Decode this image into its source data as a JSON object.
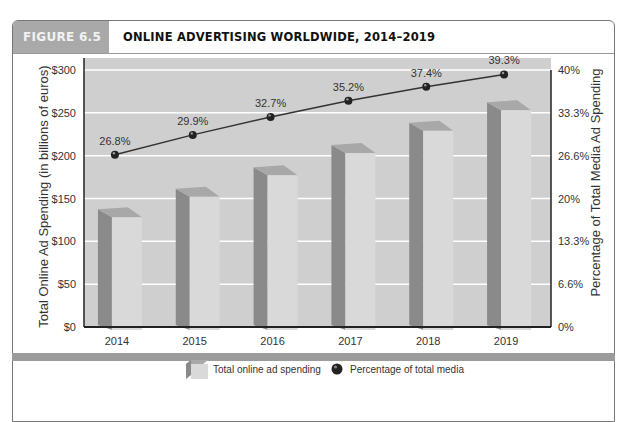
{
  "figure": {
    "tag": "FIGURE 6.5",
    "title": "ONLINE ADVERTISING WORLDWIDE, 2014–2019"
  },
  "chart_data": {
    "type": "bar",
    "title": "ONLINE ADVERTISING WORLDWIDE, 2014–2019",
    "categories": [
      "2014",
      "2015",
      "2016",
      "2017",
      "2018",
      "2019"
    ],
    "series": [
      {
        "name": "Total online ad spending",
        "type": "bar",
        "axis": "left",
        "values": [
          128,
          152,
          177,
          203,
          229,
          253
        ]
      },
      {
        "name": "Percentage of total media",
        "type": "line",
        "axis": "right",
        "values": [
          26.8,
          29.9,
          32.7,
          35.2,
          37.4,
          39.3
        ],
        "labels": [
          "26.8%",
          "29.9%",
          "32.7%",
          "35.2%",
          "37.4%",
          "39.3%"
        ]
      }
    ],
    "ylabel": "Total Online Ad Spending (in billions of euros)",
    "y2label": "Percentage of Total Media Ad Spending",
    "xlabel": "",
    "ylim": [
      0,
      300
    ],
    "y2lim": [
      0,
      40
    ],
    "yticks": [
      "$0",
      "$50",
      "$100",
      "$150",
      "$200",
      "$250",
      "$300"
    ],
    "y2ticks": [
      "0%",
      "6.6%",
      "13.3%",
      "20%",
      "26.6%",
      "33.3%",
      "40%"
    ],
    "grid": true,
    "legend": "bottom-center"
  },
  "colors": {
    "plot_bg": "#cfcfcf",
    "bar_front": "#d9d9d9",
    "bar_side": "#8a8a8a",
    "bar_top": "#a8a8a8",
    "line": "#333333",
    "grid": "#ffffff"
  }
}
